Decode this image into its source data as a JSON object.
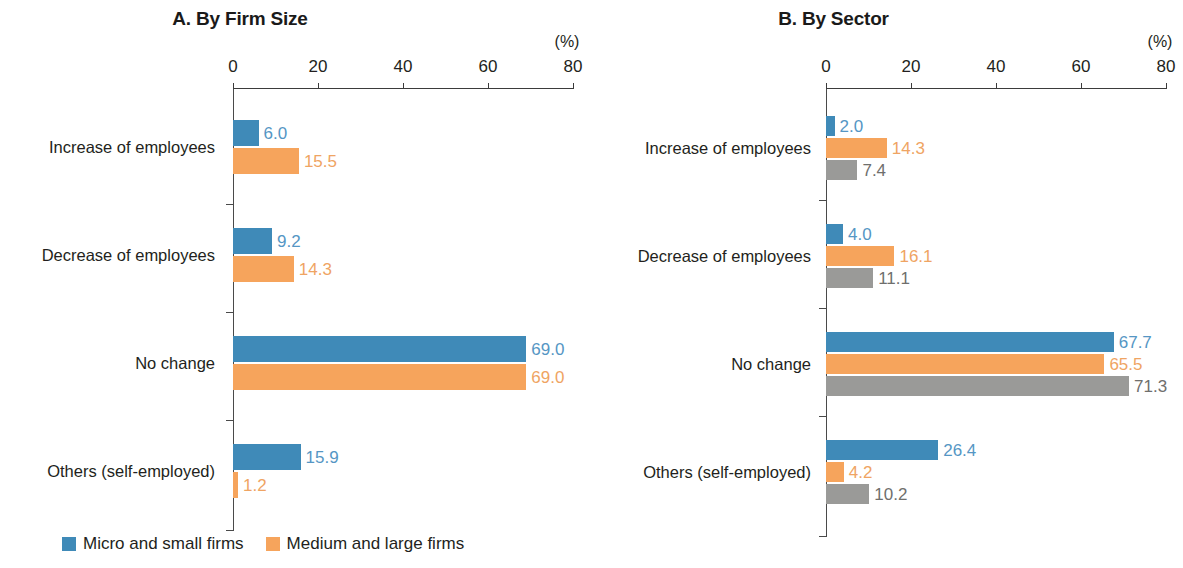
{
  "chart_data": [
    {
      "type": "bar",
      "orientation": "horizontal",
      "title": "A. By Firm Size",
      "xlabel": "(%)",
      "ylabel": "",
      "xlim": [
        0,
        80
      ],
      "xticks": [
        0,
        20,
        40,
        60,
        80
      ],
      "xticklabels": [
        "0",
        "20",
        "40",
        "60",
        "80"
      ],
      "unit": "(%)",
      "grid": false,
      "legend_position": "bottom-left",
      "categories": [
        "Increase of employees",
        "Decrease of employees",
        "No change",
        "Others (self-employed)"
      ],
      "series": [
        {
          "name": "Micro and small firms",
          "color": "#3f8ab8",
          "values": [
            6.0,
            9.2,
            69.0,
            15.9
          ],
          "labels": [
            "6.0",
            "9.2",
            "69.0",
            "15.9"
          ]
        },
        {
          "name": "Medium and large firms",
          "color": "#f6a45c",
          "values": [
            15.5,
            14.3,
            69.0,
            1.2
          ],
          "labels": [
            "15.5",
            "14.3",
            "69.0",
            "1.2"
          ]
        }
      ]
    },
    {
      "type": "bar",
      "orientation": "horizontal",
      "title": "B. By Sector",
      "xlabel": "(%)",
      "ylabel": "",
      "xlim": [
        0,
        80
      ],
      "xticks": [
        0,
        20,
        40,
        60,
        80
      ],
      "xticklabels": [
        "0",
        "20",
        "40",
        "60",
        "80"
      ],
      "unit": "(%)",
      "grid": false,
      "legend_position": "bottom-left",
      "categories": [
        "Increase of employees",
        "Decrease of employees",
        "No change",
        "Others (self-employed)"
      ],
      "series": [
        {
          "name": "Agriculture",
          "color": "#3f8ab8",
          "values": [
            2.0,
            4.0,
            67.7,
            26.4
          ],
          "labels": [
            "2.0",
            "4.0",
            "67.7",
            "26.4"
          ]
        },
        {
          "name": "Manufacturing",
          "color": "#f6a45c",
          "values": [
            14.3,
            16.1,
            65.5,
            4.2
          ],
          "labels": [
            "14.3",
            "16.1",
            "65.5",
            "4.2"
          ]
        },
        {
          "name": "Services",
          "color": "#9a9a98",
          "values": [
            7.4,
            11.1,
            71.3,
            10.2
          ],
          "labels": [
            "7.4",
            "11.1",
            "71.3",
            "10.2"
          ]
        }
      ]
    }
  ],
  "colors": {
    "blue": "#3f8ab8",
    "orange": "#f6a45c",
    "gray": "#9a9a98",
    "blue_label": "#5596c4",
    "orange_label": "#efa463",
    "gray_label": "#6f6f6d",
    "axis": "#3b3b3b",
    "text": "#231f20"
  }
}
